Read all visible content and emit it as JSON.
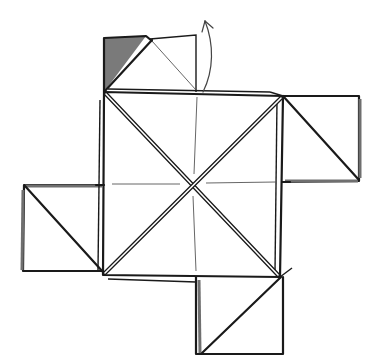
{
  "diagram": {
    "title": "",
    "type": "origami folding step",
    "colors": {
      "line": "#1a1a1a",
      "crease": "#555555",
      "shaded_back_side": "#7a7a7a",
      "background": "#ffffff"
    },
    "elements": {
      "central_square": "center-square",
      "flaps": [
        "top-flap",
        "right-flap",
        "bottom-flap",
        "left-flap"
      ],
      "arrow": "fold-up-arrow",
      "shaded_region": "top-flap-colored-side"
    }
  }
}
